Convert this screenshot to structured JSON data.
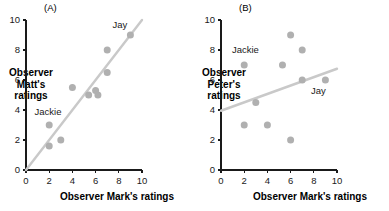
{
  "figure": {
    "dot_color": "#b0b0b0",
    "line_color": "#c9c9c9",
    "axis_color": "#1a1a1a",
    "background": "#ffffff"
  },
  "chart_data": [
    {
      "type": "scatter",
      "panel": "(A)",
      "title": "",
      "xlabel": "Observer Mark's ratings",
      "ylabel": "Observer Matt's ratings",
      "ylabel_lines": [
        "Observer",
        "Matt's",
        "ratings"
      ],
      "xlim": [
        0,
        10
      ],
      "ylim": [
        0,
        10
      ],
      "xticks": [
        0,
        2,
        4,
        6,
        8,
        10
      ],
      "yticks": [
        0,
        2,
        4,
        6,
        8,
        10
      ],
      "xtick_labels": [
        "0",
        "2",
        "4",
        "6",
        "8",
        "10"
      ],
      "ytick_labels": [
        "0",
        "2",
        "4",
        "6",
        "8",
        "10"
      ],
      "grid": false,
      "legend": false,
      "points": [
        {
          "x": 2.0,
          "y": 1.6,
          "label": ""
        },
        {
          "x": 3.0,
          "y": 2.0,
          "label": ""
        },
        {
          "x": 2.0,
          "y": 3.0,
          "label": "Jackie"
        },
        {
          "x": 4.0,
          "y": 5.5,
          "label": ""
        },
        {
          "x": 5.4,
          "y": 5.0,
          "label": ""
        },
        {
          "x": 6.0,
          "y": 5.3,
          "label": ""
        },
        {
          "x": 6.2,
          "y": 5.0,
          "label": ""
        },
        {
          "x": 7.0,
          "y": 6.5,
          "label": ""
        },
        {
          "x": 7.0,
          "y": 8.0,
          "label": ""
        },
        {
          "x": 9.0,
          "y": 9.0,
          "label": "Jay"
        }
      ],
      "annotations": [
        {
          "text": "Jackie",
          "x": 1.9,
          "y": 3.7
        },
        {
          "text": "Jay",
          "x": 8.1,
          "y": 9.5
        }
      ],
      "trend_line": {
        "x0": 0.0,
        "y0": 0.0,
        "x1": 10.0,
        "y1": 10.0
      }
    },
    {
      "type": "scatter",
      "panel": "(B)",
      "title": "",
      "xlabel": "Observer Mark's ratings",
      "ylabel": "Observer Peter's ratings",
      "ylabel_lines": [
        "Observer",
        "Peter's",
        "ratings"
      ],
      "xlim": [
        0,
        10
      ],
      "ylim": [
        0,
        10
      ],
      "xticks": [
        0,
        2,
        4,
        6,
        8,
        10
      ],
      "yticks": [
        0,
        2,
        4,
        6,
        8,
        10
      ],
      "xtick_labels": [
        "0",
        "2",
        "4",
        "6",
        "8",
        "10"
      ],
      "ytick_labels": [
        "0",
        "2",
        "4",
        "6",
        "8",
        "10"
      ],
      "grid": false,
      "legend": false,
      "points": [
        {
          "x": 2.0,
          "y": 3.0,
          "label": ""
        },
        {
          "x": 2.0,
          "y": 7.0,
          "label": "Jackie"
        },
        {
          "x": 3.0,
          "y": 4.5,
          "label": ""
        },
        {
          "x": 4.0,
          "y": 3.0,
          "label": ""
        },
        {
          "x": 5.3,
          "y": 7.0,
          "label": ""
        },
        {
          "x": 6.0,
          "y": 9.0,
          "label": ""
        },
        {
          "x": 6.0,
          "y": 2.0,
          "label": ""
        },
        {
          "x": 7.0,
          "y": 8.0,
          "label": ""
        },
        {
          "x": 7.0,
          "y": 6.0,
          "label": ""
        },
        {
          "x": 9.0,
          "y": 6.0,
          "label": "Jay"
        }
      ],
      "annotations": [
        {
          "text": "Jackie",
          "x": 2.1,
          "y": 7.8
        },
        {
          "text": "Jay",
          "x": 8.4,
          "y": 5.1
        }
      ],
      "trend_line": {
        "x0": 0.0,
        "y0": 3.95,
        "x1": 10.0,
        "y1": 6.75
      }
    }
  ]
}
